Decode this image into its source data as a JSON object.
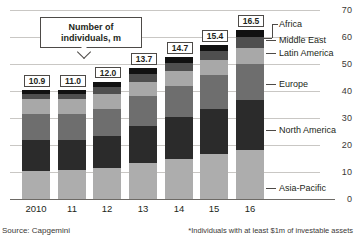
{
  "chart_data": {
    "type": "bar",
    "subtype": "stacked-bar",
    "title": "",
    "xlabel": "",
    "ylabel": "",
    "ylim": [
      0,
      70
    ],
    "yticks": [
      0,
      10,
      20,
      30,
      40,
      50,
      60,
      70
    ],
    "grid": true,
    "legend_position": "right",
    "categories": [
      "2010",
      "11",
      "12",
      "13",
      "14",
      "15",
      "16"
    ],
    "series": [
      {
        "name": "Asia-Pacific",
        "color": "#adadad",
        "values": [
          10.5,
          10.7,
          11.5,
          13.5,
          15.0,
          16.5,
          18.0
        ]
      },
      {
        "name": "North America",
        "color": "#2b2b2b",
        "values": [
          11.5,
          11.3,
          12.0,
          13.5,
          15.5,
          17.0,
          18.5
        ]
      },
      {
        "name": "Europe",
        "color": "#6e6e6e",
        "values": [
          9.5,
          9.5,
          10.0,
          11.0,
          11.5,
          12.5,
          13.5
        ]
      },
      {
        "name": "Latin America",
        "color": "#a8a8a8",
        "values": [
          5.5,
          5.5,
          5.5,
          5.5,
          5.5,
          5.5,
          6.0
        ]
      },
      {
        "name": "Middle East",
        "color": "#4f4f4f",
        "values": [
          2.0,
          2.0,
          2.5,
          3.0,
          3.0,
          3.5,
          4.0
        ]
      },
      {
        "name": "Africa",
        "color": "#111111",
        "values": [
          1.5,
          1.5,
          2.0,
          2.0,
          2.0,
          2.0,
          2.5
        ]
      }
    ],
    "value_labels": [
      "10.9",
      "11.0",
      "12.0",
      "13.7",
      "14.7",
      "15.4",
      "16.5"
    ],
    "annotation": {
      "line1": "Number of",
      "line2": "individuals, m"
    },
    "source": "Source: Capgemini",
    "footnote": "*Individuals with at least $1m of investable assets"
  }
}
